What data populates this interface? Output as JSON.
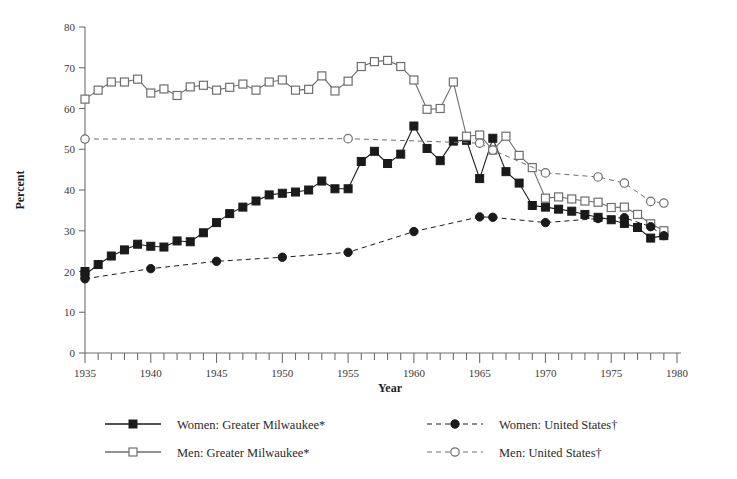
{
  "chart_data": {
    "type": "line",
    "title": "",
    "xlabel": "Year",
    "ylabel": "Percent",
    "xlim": [
      1935,
      1980
    ],
    "ylim": [
      0,
      80
    ],
    "ytick_step": 10,
    "xtick_step": 1,
    "xtick_label_step": 5,
    "ytick_labels": [
      "0",
      "10",
      "20",
      "30",
      "40",
      "50",
      "60",
      "70",
      "80"
    ],
    "xtick_labels": [
      "1935",
      "1940",
      "1945",
      "1950",
      "1955",
      "1960",
      "1965",
      "1970",
      "1975",
      "1980"
    ],
    "grid": false,
    "legend_position": "bottom",
    "series": [
      {
        "name": "Women: Greater Milwaukee*",
        "marker": "filled-square",
        "line": "solid",
        "color": "#1a1a1a",
        "x": [
          1935,
          1935,
          1936,
          1937,
          1938,
          1939,
          1940,
          1941,
          1942,
          1943,
          1944,
          1945,
          1946,
          1947,
          1948,
          1949,
          1950,
          1951,
          1952,
          1953,
          1954,
          1955,
          1956,
          1957,
          1958,
          1959,
          1960,
          1961,
          1962,
          1963,
          1964,
          1965,
          1966,
          1967,
          1968,
          1969,
          1970,
          1971,
          1972,
          1973,
          1974,
          1975,
          1976,
          1977,
          1978,
          1979
        ],
        "y": [
          20.0,
          19.2,
          21.7,
          23.8,
          25.3,
          26.7,
          26.2,
          26.0,
          27.5,
          27.3,
          29.5,
          32.0,
          34.2,
          35.8,
          37.3,
          38.8,
          39.2,
          39.5,
          40.0,
          42.2,
          40.3,
          40.3,
          47.0,
          49.5,
          46.5,
          48.8,
          55.7,
          50.2,
          47.2,
          52.0,
          52.2,
          42.8,
          52.7,
          44.5,
          41.7,
          36.2,
          35.8,
          35.3,
          34.8,
          34.0,
          33.3,
          32.7,
          31.8,
          30.8,
          28.2,
          28.8
        ]
      },
      {
        "name": "Men: Greater Milwaukee*",
        "marker": "open-square",
        "line": "solid",
        "color": "#6e6e6e",
        "x": [
          1935,
          1936,
          1937,
          1938,
          1939,
          1940,
          1941,
          1942,
          1943,
          1944,
          1945,
          1946,
          1947,
          1948,
          1949,
          1950,
          1951,
          1952,
          1953,
          1954,
          1955,
          1956,
          1957,
          1958,
          1959,
          1960,
          1961,
          1962,
          1963,
          1964,
          1965,
          1966,
          1967,
          1968,
          1969,
          1970,
          1971,
          1972,
          1973,
          1974,
          1975,
          1976,
          1977,
          1978,
          1979
        ],
        "y": [
          62.3,
          64.5,
          66.5,
          66.5,
          67.2,
          63.8,
          64.8,
          63.2,
          65.3,
          65.7,
          64.5,
          65.2,
          66.0,
          64.5,
          66.5,
          67.0,
          64.5,
          64.7,
          68.0,
          64.3,
          66.7,
          70.3,
          71.5,
          71.8,
          70.3,
          67.0,
          59.8,
          60.0,
          66.5,
          53.2,
          53.5,
          49.8,
          53.2,
          48.5,
          45.5,
          38.0,
          38.3,
          37.8,
          37.3,
          37.0,
          35.7,
          35.8,
          34.0,
          31.7,
          30.0
        ]
      },
      {
        "name": "Women: United States†",
        "marker": "filled-circle",
        "line": "dashed",
        "color": "#1a1a1a",
        "x": [
          1935,
          1940,
          1945,
          1950,
          1955,
          1960,
          1965,
          1966,
          1970,
          1974,
          1976,
          1978,
          1979
        ],
        "y": [
          18.2,
          20.7,
          22.5,
          23.5,
          24.7,
          29.8,
          33.4,
          33.3,
          32.0,
          33.0,
          33.2,
          31.0,
          28.8
        ]
      },
      {
        "name": "Men: United States†",
        "marker": "open-circle",
        "line": "dashed",
        "color": "#6e6e6e",
        "x": [
          1935,
          1955,
          1965,
          1966,
          1970,
          1974,
          1976,
          1978,
          1979
        ],
        "y": [
          52.5,
          52.6,
          51.5,
          49.8,
          44.2,
          43.2,
          41.7,
          37.2,
          36.8
        ]
      }
    ]
  },
  "axes": {
    "ylabel": "Percent",
    "xlabel": "Year"
  },
  "legend": {
    "entries": [
      {
        "label": "Women: Greater Milwaukee*",
        "marker": "filled-square",
        "line": "solid"
      },
      {
        "label": "Women: United States†",
        "marker": "filled-circle",
        "line": "dashed"
      },
      {
        "label": "Men: Greater Milwaukee*",
        "marker": "open-square",
        "line": "solid"
      },
      {
        "label": "Men: United States†",
        "marker": "open-circle",
        "line": "dashed"
      }
    ]
  },
  "colors": {
    "dark": "#1a1a1a",
    "gray": "#6e6e6e",
    "background": "#ffffff"
  }
}
